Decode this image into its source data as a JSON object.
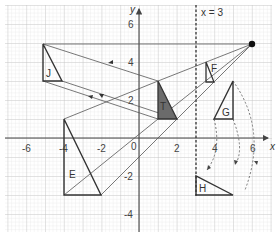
{
  "diagram": {
    "axes": {
      "x_label": "x",
      "y_label": "y",
      "x_ticks": [
        "-6",
        "-4",
        "-2",
        "0",
        "2",
        "4",
        "6"
      ],
      "y_ticks": [
        "6",
        "4",
        "2",
        "-2",
        "-4"
      ],
      "x_range": [
        -7,
        7
      ],
      "y_range": [
        -5,
        7
      ]
    },
    "mirror_line": {
      "label": "x = 3",
      "x": 3
    },
    "centre_of_enlargement": {
      "x": 6,
      "y": 5
    },
    "shapes": [
      {
        "name": "T",
        "label": "T",
        "vertices": [
          [
            1,
            3
          ],
          [
            1,
            1
          ],
          [
            2,
            1
          ]
        ],
        "fill": "#6b6b6b"
      },
      {
        "name": "J",
        "label": "J",
        "vertices": [
          [
            -5,
            5
          ],
          [
            -5,
            2
          ],
          [
            -4,
            2
          ]
        ]
      },
      {
        "name": "F",
        "label": "F",
        "vertices": [
          [
            4,
            4
          ],
          [
            4,
            3
          ],
          [
            4.4,
            3
          ]
        ]
      },
      {
        "name": "G",
        "label": "G",
        "vertices": [
          [
            5,
            3
          ],
          [
            4,
            1
          ],
          [
            5,
            1
          ]
        ]
      },
      {
        "name": "H",
        "label": "H",
        "vertices": [
          [
            3,
            -2
          ],
          [
            3,
            -3
          ],
          [
            5,
            -3
          ]
        ]
      },
      {
        "name": "E",
        "label": "E",
        "vertices": [
          [
            -4,
            1
          ],
          [
            -4,
            -3
          ],
          [
            -2,
            -3
          ]
        ]
      }
    ],
    "colors": {
      "grid_minor": "#d9d9d9",
      "grid_major": "#bdbdbd",
      "axis": "#444444",
      "shape_stroke": "#333333",
      "t_fill": "#6b6b6b"
    }
  }
}
